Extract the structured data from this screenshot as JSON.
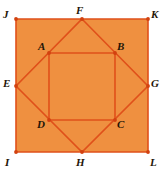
{
  "figure": {
    "width": 166,
    "height": 172,
    "background_color": "#ffffff",
    "fill_color": "#ef9040",
    "stroke_color": "#e0501a",
    "stroke_width": 1.6,
    "vertex_dot_color": "#d2410f",
    "label_color": "#241507"
  },
  "shapes": {
    "outer_square": {
      "name": "JKLI",
      "points": "16,19 148,19 148,152 16,152",
      "vertices": [
        "J",
        "K",
        "L",
        "I"
      ]
    },
    "diamond_square": {
      "name": "FGHE",
      "points": "82,19 148,86 82,152 16,86",
      "vertices": [
        "F",
        "G",
        "H",
        "E"
      ]
    },
    "inner_square": {
      "name": "ABCD",
      "points": "49,53 115,53 115,120 49,120",
      "vertices": [
        "A",
        "B",
        "C",
        "D"
      ]
    }
  },
  "points": [
    {
      "id": "J",
      "label": "J",
      "x": 16,
      "y": 19,
      "label_x": 3,
      "label_y": 9,
      "group": "outer"
    },
    {
      "id": "F",
      "label": "F",
      "x": 82,
      "y": 19,
      "label_x": 76,
      "label_y": 5,
      "group": "diamond"
    },
    {
      "id": "K",
      "label": "K",
      "x": 148,
      "y": 19,
      "label_x": 151,
      "label_y": 9,
      "group": "outer"
    },
    {
      "id": "A",
      "label": "A",
      "x": 49,
      "y": 53,
      "label_x": 38,
      "label_y": 41,
      "group": "inner"
    },
    {
      "id": "B",
      "label": "B",
      "x": 115,
      "y": 53,
      "label_x": 117,
      "label_y": 41,
      "group": "inner"
    },
    {
      "id": "E",
      "label": "E",
      "x": 16,
      "y": 86,
      "label_x": 3,
      "label_y": 78,
      "group": "diamond"
    },
    {
      "id": "G",
      "label": "G",
      "x": 148,
      "y": 86,
      "label_x": 151,
      "label_y": 78,
      "group": "diamond"
    },
    {
      "id": "D",
      "label": "D",
      "x": 49,
      "y": 120,
      "label_x": 37,
      "label_y": 119,
      "group": "inner"
    },
    {
      "id": "C",
      "label": "C",
      "x": 115,
      "y": 120,
      "label_x": 117,
      "label_y": 119,
      "group": "inner"
    },
    {
      "id": "I",
      "label": "I",
      "x": 16,
      "y": 152,
      "label_x": 5,
      "label_y": 157,
      "group": "outer"
    },
    {
      "id": "H",
      "label": "H",
      "x": 82,
      "y": 152,
      "label_x": 76,
      "label_y": 157,
      "group": "diamond"
    },
    {
      "id": "L",
      "label": "L",
      "x": 148,
      "y": 152,
      "label_x": 150,
      "label_y": 157,
      "group": "outer"
    }
  ]
}
